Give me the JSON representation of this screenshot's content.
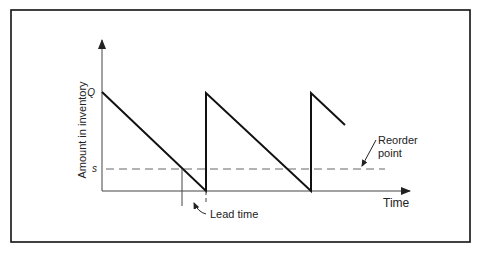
{
  "diagram": {
    "type": "inventory-sawtooth",
    "y_axis_label": "Amount in inventory",
    "x_axis_label": "Time",
    "q_label": "Q",
    "s_label": "s",
    "reorder_label_line1": "Reorder",
    "reorder_label_line2": "point",
    "lead_time_label": "Lead time",
    "colors": {
      "line": "#111111",
      "frame": "#111111",
      "dashed": "#666666",
      "axis": "#444444"
    }
  }
}
